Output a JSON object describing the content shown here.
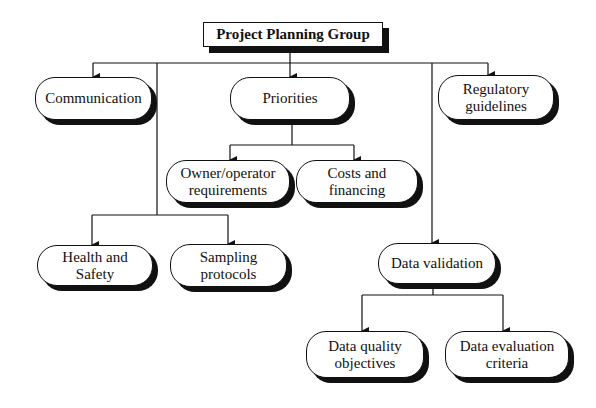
{
  "diagram": {
    "root": {
      "label": "Project Planning Group"
    },
    "nodes": {
      "communication": {
        "label": "Communication"
      },
      "priorities": {
        "label": "Priorities"
      },
      "regulatory": {
        "line1": "Regulatory",
        "line2": "guidelines"
      },
      "owner": {
        "line1": "Owner/operator",
        "line2": "requirements"
      },
      "costs": {
        "line1": "Costs and",
        "line2": "financing"
      },
      "health": {
        "line1": "Health and",
        "line2": "Safety"
      },
      "sampling": {
        "line1": "Sampling",
        "line2": "protocols"
      },
      "data_validation": {
        "label": "Data validation"
      },
      "dqo": {
        "line1": "Data quality",
        "line2": "objectives"
      },
      "dec": {
        "line1": "Data evaluation",
        "line2": "criteria"
      }
    },
    "edges": [
      [
        "Project Planning Group",
        "Communication"
      ],
      [
        "Project Planning Group",
        "Priorities"
      ],
      [
        "Project Planning Group",
        "Regulatory guidelines"
      ],
      [
        "Project Planning Group",
        "Health and Safety"
      ],
      [
        "Project Planning Group",
        "Sampling protocols"
      ],
      [
        "Project Planning Group",
        "Data validation"
      ],
      [
        "Priorities",
        "Owner/operator requirements"
      ],
      [
        "Priorities",
        "Costs and financing"
      ],
      [
        "Data validation",
        "Data quality objectives"
      ],
      [
        "Data validation",
        "Data evaluation criteria"
      ]
    ]
  }
}
